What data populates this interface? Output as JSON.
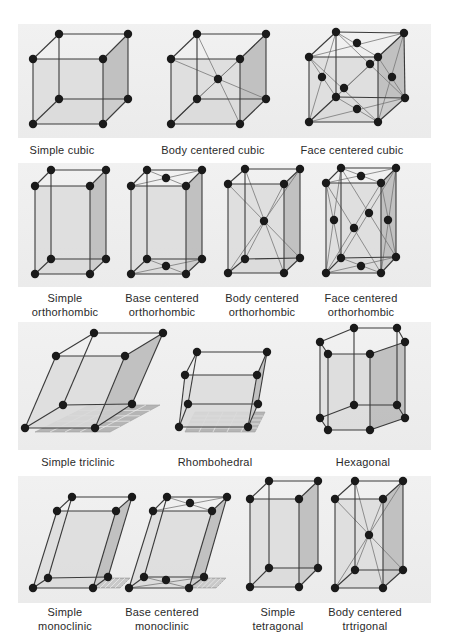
{
  "colors": {
    "atom": "#1a1a1a",
    "edge": "#3a3a3a",
    "diagonal": "#777777",
    "face_light": "#d9d9d9",
    "face_dark": "#b8b8b8",
    "panel": "#eeeeee",
    "grid": "#a0a0a0"
  },
  "panels": [
    {
      "y": 24,
      "h": 114
    },
    {
      "y": 163,
      "h": 124
    },
    {
      "y": 322,
      "h": 128
    },
    {
      "y": 476,
      "h": 127
    }
  ],
  "lattices": [
    {
      "id": "simple-cubic",
      "label_lines": [
        "Simple cubic"
      ],
      "label_x": 62,
      "label_y": 143,
      "corners": [
        [
          33,
          124
        ],
        [
          103,
          124
        ],
        [
          128,
          99
        ],
        [
          59,
          99
        ],
        [
          33,
          59
        ],
        [
          103,
          59
        ],
        [
          128,
          34
        ],
        [
          59,
          34
        ]
      ],
      "extra_atoms": [],
      "diagonals": []
    },
    {
      "id": "body-centered-cubic",
      "label_lines": [
        "Body centered cubic"
      ],
      "label_x": 213,
      "label_y": 143,
      "corners": [
        [
          171,
          124
        ],
        [
          240,
          124
        ],
        [
          266,
          99
        ],
        [
          197,
          99
        ],
        [
          171,
          59
        ],
        [
          240,
          59
        ],
        [
          266,
          34
        ],
        [
          197,
          34
        ]
      ],
      "extra_atoms": [
        [
          218,
          79
        ]
      ],
      "diagonals": [
        [
          [
            171,
            59
          ],
          [
            266,
            99
          ]
        ],
        [
          [
            197,
            34
          ],
          [
            240,
            124
          ]
        ],
        [
          [
            240,
            59
          ],
          [
            197,
            99
          ]
        ],
        [
          [
            266,
            34
          ],
          [
            171,
            124
          ]
        ]
      ]
    },
    {
      "id": "face-centered-cubic",
      "label_lines": [
        "Face centered cubic"
      ],
      "label_x": 352,
      "label_y": 143,
      "corners": [
        [
          309,
          122
        ],
        [
          378,
          122
        ],
        [
          405,
          98
        ],
        [
          336,
          97
        ],
        [
          309,
          57
        ],
        [
          378,
          57
        ],
        [
          404,
          33
        ],
        [
          336,
          32
        ]
      ],
      "extra_atoms": [
        [
          357,
          43
        ],
        [
          322,
          77
        ],
        [
          392,
          77
        ],
        [
          344,
          88
        ],
        [
          370,
          64
        ],
        [
          357,
          109
        ]
      ],
      "diagonals": [
        [
          [
            309,
            57
          ],
          [
            404,
            33
          ]
        ],
        [
          [
            336,
            32
          ],
          [
            378,
            57
          ]
        ],
        [
          [
            309,
            122
          ],
          [
            405,
            98
          ]
        ],
        [
          [
            336,
            97
          ],
          [
            378,
            122
          ]
        ],
        [
          [
            309,
            57
          ],
          [
            336,
            97
          ]
        ],
        [
          [
            336,
            32
          ],
          [
            309,
            122
          ]
        ],
        [
          [
            378,
            57
          ],
          [
            405,
            98
          ]
        ],
        [
          [
            404,
            33
          ],
          [
            378,
            122
          ]
        ],
        [
          [
            309,
            57
          ],
          [
            378,
            122
          ]
        ],
        [
          [
            378,
            57
          ],
          [
            309,
            122
          ]
        ],
        [
          [
            336,
            32
          ],
          [
            405,
            98
          ]
        ],
        [
          [
            404,
            33
          ],
          [
            336,
            97
          ]
        ]
      ]
    },
    {
      "id": "simple-orthorhombic",
      "label_lines": [
        "Simple",
        "orthorhombic"
      ],
      "label_x": 65,
      "label_y": 291,
      "corners": [
        [
          35,
          274
        ],
        [
          90,
          274
        ],
        [
          106,
          259
        ],
        [
          51,
          259
        ],
        [
          35,
          186
        ],
        [
          90,
          186
        ],
        [
          106,
          170
        ],
        [
          51,
          170
        ]
      ],
      "extra_atoms": [],
      "diagonals": []
    },
    {
      "id": "base-centered-orthorhombic",
      "label_lines": [
        "Base centered",
        "orthorhombic"
      ],
      "label_x": 162,
      "label_y": 291,
      "corners": [
        [
          131,
          274
        ],
        [
          186,
          274
        ],
        [
          202,
          259
        ],
        [
          147,
          259
        ],
        [
          131,
          186
        ],
        [
          186,
          186
        ],
        [
          202,
          170
        ],
        [
          147,
          170
        ]
      ],
      "extra_atoms": [
        [
          166,
          178
        ],
        [
          166,
          266
        ]
      ],
      "diagonals": [
        [
          [
            131,
            186
          ],
          [
            202,
            170
          ]
        ],
        [
          [
            147,
            170
          ],
          [
            186,
            186
          ]
        ],
        [
          [
            131,
            274
          ],
          [
            202,
            259
          ]
        ],
        [
          [
            147,
            259
          ],
          [
            186,
            274
          ]
        ]
      ]
    },
    {
      "id": "body-centered-orthorhombic",
      "label_lines": [
        "Body centered",
        "orthorhombic"
      ],
      "label_x": 262,
      "label_y": 291,
      "corners": [
        [
          228,
          273
        ],
        [
          284,
          273
        ],
        [
          300,
          258
        ],
        [
          245,
          259
        ],
        [
          228,
          184
        ],
        [
          284,
          184
        ],
        [
          300,
          169
        ],
        [
          245,
          169
        ]
      ],
      "extra_atoms": [
        [
          264,
          221
        ]
      ],
      "diagonals": [
        [
          [
            228,
            184
          ],
          [
            300,
            258
          ]
        ],
        [
          [
            245,
            169
          ],
          [
            284,
            273
          ]
        ],
        [
          [
            284,
            184
          ],
          [
            245,
            259
          ]
        ],
        [
          [
            300,
            169
          ],
          [
            228,
            273
          ]
        ]
      ]
    },
    {
      "id": "face-centered-orthorhombic",
      "label_lines": [
        "Face centered",
        "orthorhombic"
      ],
      "label_x": 361,
      "label_y": 291,
      "corners": [
        [
          326,
          273
        ],
        [
          381,
          273
        ],
        [
          396,
          257
        ],
        [
          341,
          258
        ],
        [
          326,
          183
        ],
        [
          381,
          183
        ],
        [
          396,
          168
        ],
        [
          341,
          168
        ]
      ],
      "extra_atoms": [
        [
          361,
          176
        ],
        [
          334,
          220
        ],
        [
          388,
          220
        ],
        [
          354,
          228
        ],
        [
          369,
          213
        ],
        [
          361,
          266
        ]
      ],
      "diagonals": [
        [
          [
            326,
            183
          ],
          [
            396,
            168
          ]
        ],
        [
          [
            341,
            168
          ],
          [
            381,
            183
          ]
        ],
        [
          [
            326,
            273
          ],
          [
            396,
            257
          ]
        ],
        [
          [
            341,
            258
          ],
          [
            381,
            273
          ]
        ],
        [
          [
            326,
            183
          ],
          [
            341,
            258
          ]
        ],
        [
          [
            341,
            168
          ],
          [
            326,
            273
          ]
        ],
        [
          [
            381,
            183
          ],
          [
            396,
            257
          ]
        ],
        [
          [
            396,
            168
          ],
          [
            381,
            273
          ]
        ],
        [
          [
            326,
            183
          ],
          [
            381,
            273
          ]
        ],
        [
          [
            381,
            183
          ],
          [
            326,
            273
          ]
        ],
        [
          [
            341,
            168
          ],
          [
            396,
            257
          ]
        ],
        [
          [
            396,
            168
          ],
          [
            341,
            258
          ]
        ]
      ]
    },
    {
      "id": "simple-triclinic",
      "label_lines": [
        "Simple triclinic"
      ],
      "label_x": 78,
      "label_y": 455,
      "corners": [
        [
          25,
          428
        ],
        [
          95,
          428
        ],
        [
          132,
          404
        ],
        [
          63,
          405
        ],
        [
          56,
          356
        ],
        [
          125,
          356
        ],
        [
          163,
          333
        ],
        [
          94,
          333
        ]
      ],
      "extra_atoms": [],
      "diagonals": [],
      "floor_grid": [
        [
          35,
          432
        ],
        [
          110,
          432
        ],
        [
          160,
          405
        ],
        [
          90,
          405
        ]
      ]
    },
    {
      "id": "rhombohedral",
      "label_lines": [
        "Rhombohedral"
      ],
      "label_x": 215,
      "label_y": 455,
      "corners": [
        [
          179,
          427
        ],
        [
          248,
          427
        ],
        [
          258,
          404
        ],
        [
          188,
          404
        ],
        [
          185,
          375
        ],
        [
          257,
          375
        ],
        [
          267,
          352
        ],
        [
          197,
          352
        ]
      ],
      "extra_atoms": [],
      "diagonals": [],
      "floor_grid": [
        [
          185,
          432
        ],
        [
          255,
          432
        ],
        [
          265,
          412
        ],
        [
          195,
          412
        ]
      ]
    },
    {
      "id": "hexagonal",
      "label_lines": [
        "Hexagonal"
      ],
      "label_x": 363,
      "label_y": 455,
      "hex_top": [
        [
          354,
          328
        ],
        [
          397,
          328
        ],
        [
          405,
          342
        ],
        [
          370,
          354
        ],
        [
          328,
          354
        ],
        [
          320,
          342
        ]
      ],
      "hex_bottom": [
        [
          354,
          405
        ],
        [
          397,
          405
        ],
        [
          405,
          418
        ],
        [
          370,
          430
        ],
        [
          328,
          430
        ],
        [
          320,
          418
        ]
      ],
      "hex_centers": [
        [
          362,
          342
        ],
        [
          362,
          418
        ]
      ]
    },
    {
      "id": "simple-monoclinic",
      "label_lines": [
        "Simple",
        "monoclinic"
      ],
      "label_x": 65,
      "label_y": 605,
      "corners": [
        [
          33,
          588
        ],
        [
          93,
          588
        ],
        [
          108,
          577
        ],
        [
          48,
          578
        ],
        [
          57,
          511
        ],
        [
          116,
          511
        ],
        [
          132,
          497
        ],
        [
          72,
          497
        ]
      ],
      "extra_atoms": [],
      "diagonals": [],
      "floor_grid": [
        [
          95,
          588
        ],
        [
          120,
          588
        ],
        [
          130,
          578
        ],
        [
          105,
          578
        ]
      ]
    },
    {
      "id": "base-centered-monoclinic",
      "label_lines": [
        "Base centered",
        "monoclinic"
      ],
      "label_x": 162,
      "label_y": 605,
      "corners": [
        [
          129,
          588
        ],
        [
          189,
          588
        ],
        [
          204,
          577
        ],
        [
          144,
          577
        ],
        [
          153,
          511
        ],
        [
          212,
          511
        ],
        [
          227,
          497
        ],
        [
          167,
          497
        ]
      ],
      "extra_atoms": [
        [
          190,
          503
        ],
        [
          166,
          580
        ]
      ],
      "diagonals": [
        [
          [
            153,
            511
          ],
          [
            227,
            497
          ]
        ],
        [
          [
            167,
            497
          ],
          [
            212,
            511
          ]
        ],
        [
          [
            129,
            588
          ],
          [
            204,
            577
          ]
        ],
        [
          [
            144,
            577
          ],
          [
            189,
            588
          ]
        ]
      ],
      "floor_grid": [
        [
          192,
          588
        ],
        [
          216,
          588
        ],
        [
          226,
          578
        ],
        [
          202,
          578
        ]
      ]
    },
    {
      "id": "simple-tetragonal",
      "label_lines": [
        "Simple",
        "tetragonal"
      ],
      "label_x": 278,
      "label_y": 605,
      "corners": [
        [
          250,
          587
        ],
        [
          299,
          587
        ],
        [
          318,
          568
        ],
        [
          269,
          568
        ],
        [
          250,
          499
        ],
        [
          299,
          499
        ],
        [
          318,
          481
        ],
        [
          269,
          481
        ]
      ],
      "extra_atoms": [],
      "diagonals": []
    },
    {
      "id": "body-centered-tetragonal",
      "label_lines": [
        "Body centered",
        "trtrigonal"
      ],
      "label_x": 365,
      "label_y": 605,
      "corners": [
        [
          335,
          588
        ],
        [
          383,
          588
        ],
        [
          403,
          570
        ],
        [
          355,
          570
        ],
        [
          335,
          499
        ],
        [
          383,
          499
        ],
        [
          403,
          481
        ],
        [
          355,
          481
        ]
      ],
      "extra_atoms": [
        [
          369,
          535
        ]
      ],
      "diagonals": [
        [
          [
            335,
            499
          ],
          [
            403,
            570
          ]
        ],
        [
          [
            355,
            481
          ],
          [
            383,
            588
          ]
        ],
        [
          [
            383,
            499
          ],
          [
            355,
            570
          ]
        ],
        [
          [
            403,
            481
          ],
          [
            335,
            588
          ]
        ]
      ]
    }
  ]
}
